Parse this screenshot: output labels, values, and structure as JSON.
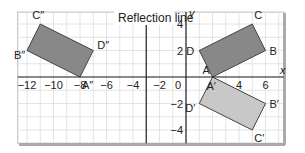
{
  "figure": {
    "title": "Reflection line",
    "axis_labels": {
      "x": "x",
      "y": "y"
    },
    "x_ticks": [
      "−12",
      "−10",
      "−8",
      "−6",
      "−4",
      "−2",
      "0",
      "4",
      "6"
    ],
    "y_ticks": [
      "4",
      "2",
      "−2",
      "−4"
    ],
    "reflection_line_x": -3,
    "shapes": [
      {
        "name": "ABCD",
        "fill": "#888888",
        "vertices": [
          {
            "label": "A",
            "x": 2,
            "y": 0
          },
          {
            "label": "B",
            "x": 6,
            "y": 2
          },
          {
            "label": "C",
            "x": 5,
            "y": 4
          },
          {
            "label": "D",
            "x": 1,
            "y": 2
          }
        ]
      },
      {
        "name": "A'B'C'D'",
        "fill": "#c8c8c8",
        "vertices": [
          {
            "label": "A′",
            "x": 2,
            "y": 0
          },
          {
            "label": "B′",
            "x": 6,
            "y": -2
          },
          {
            "label": "C′",
            "x": 5,
            "y": -4
          },
          {
            "label": "D′",
            "x": 1,
            "y": -2
          }
        ]
      },
      {
        "name": "A''B''C''D''",
        "fill": "#888888",
        "vertices": [
          {
            "label": "A″",
            "x": -8,
            "y": 0
          },
          {
            "label": "B″",
            "x": -12,
            "y": 2
          },
          {
            "label": "C″",
            "x": -11,
            "y": 4
          },
          {
            "label": "D″",
            "x": -7,
            "y": 2
          }
        ]
      }
    ]
  }
}
